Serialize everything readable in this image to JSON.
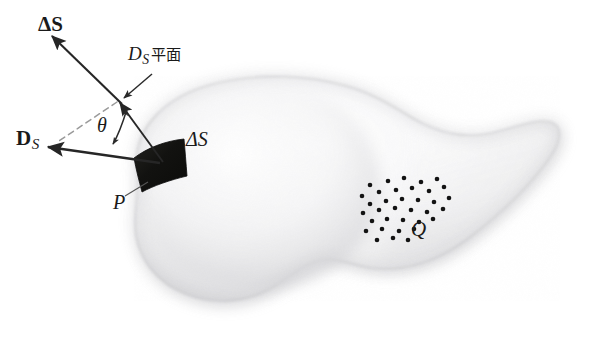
{
  "figure": {
    "background_color": "#ffffff",
    "width": 592,
    "height": 348
  },
  "labels": {
    "delta_s_vector": {
      "symbol": "ΔS",
      "style": "bold-vector",
      "meaning": "surface-element-normal-vector"
    },
    "ds_plane": {
      "symbol": "D",
      "subscript": "S",
      "suffix": "平面",
      "style": "italic",
      "meaning": "D-sub-S-plane"
    },
    "ds_vector": {
      "symbol": "D",
      "subscript": "S",
      "style": "bold-vector",
      "meaning": "electric-flux-density-vector"
    },
    "theta": {
      "symbol": "θ",
      "style": "italic",
      "meaning": "angle-between-D-and-normal"
    },
    "delta_s_scalar": {
      "symbol": "ΔS",
      "style": "italic",
      "meaning": "surface-element-area"
    },
    "point_p": {
      "symbol": "P",
      "style": "italic",
      "meaning": "point-on-surface"
    },
    "charge_q": {
      "symbol": "Q",
      "style": "italic",
      "meaning": "enclosed-charge"
    }
  },
  "colors": {
    "ink": "#1a1a1a",
    "arrow": "#262626",
    "dashed_guide": "#9a9a9a",
    "blob_light": "#fdfdfd",
    "blob_mid": "#ececed",
    "blob_shade": "#d2d2d4",
    "blob_edge": "#c4c4c6",
    "patch_dark": "#141414",
    "dot": "#131313",
    "background": "#ffffff"
  },
  "geometry": {
    "blob_outline": "M 137 168 C 133 128, 166 96, 214 84 C 262 72, 310 76, 346 86 C 372 93, 392 106, 412 118 C 436 132, 462 140, 492 133 C 520 126, 541 117, 553 123 C 563 128, 561 142, 548 160 C 529 186, 500 214, 470 237 C 440 260, 406 272, 372 268 C 352 265, 340 258, 326 259 C 310 260, 296 272, 276 285 C 250 302, 216 306, 186 294 C 158 283, 141 262, 136 236 C 132 212, 141 192, 137 168 Z",
    "surface_patch": "M 136 156 C 150 147, 168 141, 183 140 C 184 152, 186 164, 187 175 C 172 179, 155 185, 143 190 C 140 178, 138 167, 136 156 Z",
    "vertex": {
      "x": 119,
      "y": 101
    },
    "patch_anchor": {
      "x": 162,
      "y": 163
    },
    "normal_tip": {
      "x": 50,
      "y": 35
    },
    "ds_tip": {
      "x": 48,
      "y": 147
    },
    "dashed_end": {
      "x": 57,
      "y": 143
    },
    "charge_dots": [
      [
        370,
        185
      ],
      [
        388,
        181
      ],
      [
        404,
        178
      ],
      [
        421,
        182
      ],
      [
        437,
        179
      ],
      [
        362,
        196
      ],
      [
        379,
        192
      ],
      [
        396,
        190
      ],
      [
        412,
        188
      ],
      [
        429,
        191
      ],
      [
        444,
        187
      ],
      [
        370,
        204
      ],
      [
        386,
        201
      ],
      [
        402,
        199
      ],
      [
        418,
        200
      ],
      [
        434,
        202
      ],
      [
        449,
        198
      ],
      [
        363,
        213
      ],
      [
        379,
        210
      ],
      [
        395,
        208
      ],
      [
        411,
        210
      ],
      [
        427,
        212
      ],
      [
        443,
        209
      ],
      [
        372,
        221
      ],
      [
        387,
        219
      ],
      [
        403,
        220
      ],
      [
        419,
        222
      ],
      [
        433,
        219
      ],
      [
        366,
        231
      ],
      [
        382,
        229
      ],
      [
        399,
        231
      ],
      [
        414,
        229
      ],
      [
        377,
        240
      ],
      [
        393,
        238
      ],
      [
        408,
        240
      ]
    ],
    "dot_radius": 2.3
  }
}
